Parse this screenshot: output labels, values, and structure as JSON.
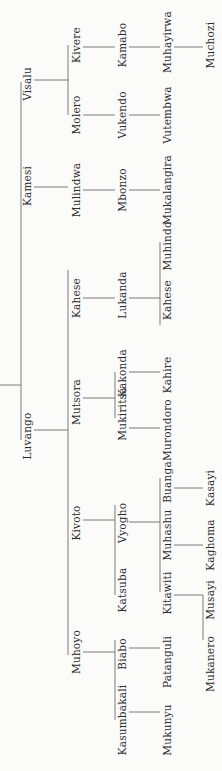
{
  "diagram": {
    "type": "genealogy-tree",
    "orientation": "rotated-90-ccw",
    "line_color": "#7a7a7a",
    "text_color": "#2a2a2a",
    "nodes": [
      {
        "id": "visalu",
        "name": "Visalu",
        "gen": 1,
        "x": 27,
        "y": 84
      },
      {
        "id": "kamesi",
        "name": "Kamesi",
        "gen": 1,
        "x": 27,
        "y": 186
      },
      {
        "id": "luvango",
        "name": "Luvango",
        "gen": 1,
        "x": 27,
        "y": 436
      },
      {
        "id": "kivere",
        "name": "Kivere",
        "gen": 2,
        "x": 76,
        "y": 45,
        "parent": "visalu"
      },
      {
        "id": "molero",
        "name": "Molero",
        "gen": 2,
        "x": 76,
        "y": 115,
        "parent": "visalu"
      },
      {
        "id": "mulindwa",
        "name": "Mulindwa",
        "gen": 2,
        "x": 76,
        "y": 190,
        "parent": "kamesi"
      },
      {
        "id": "kahese1",
        "name": "Kahese",
        "gen": 2,
        "x": 76,
        "y": 298,
        "parent": "luvango"
      },
      {
        "id": "mutsora",
        "name": "Mutsora",
        "gen": 2,
        "x": 76,
        "y": 402,
        "parent": "luvango"
      },
      {
        "id": "kivoto",
        "name": "Kivoto",
        "gen": 2,
        "x": 76,
        "y": 523,
        "parent": "luvango"
      },
      {
        "id": "muhoyo",
        "name": "Muhoyo",
        "gen": 2,
        "x": 76,
        "y": 652,
        "parent": "luvango"
      },
      {
        "id": "kamabo",
        "name": "Kamabo",
        "gen": 3,
        "x": 122,
        "y": 45,
        "parent": "kivere"
      },
      {
        "id": "vukendo",
        "name": "Vukendo",
        "gen": 3,
        "x": 122,
        "y": 115,
        "parent": "molero"
      },
      {
        "id": "mbonzo",
        "name": "Mbonzo",
        "gen": 3,
        "x": 122,
        "y": 190,
        "parent": "mulindwa"
      },
      {
        "id": "lukanda",
        "name": "Lukanda",
        "gen": 3,
        "x": 122,
        "y": 295,
        "parent": "kahese1"
      },
      {
        "id": "kakonda",
        "name": "Kakonda",
        "gen": 3,
        "x": 122,
        "y": 373,
        "parent": "mutsora"
      },
      {
        "id": "mukiritsa",
        "name": "Mukiritsa",
        "gen": 3,
        "x": 122,
        "y": 414,
        "parent": "mutsora"
      },
      {
        "id": "vyogho",
        "name": "Vyogho",
        "gen": 3,
        "x": 122,
        "y": 523,
        "parent": "kivoto"
      },
      {
        "id": "katsuba",
        "name": "Katsuba",
        "gen": 3,
        "x": 122,
        "y": 590,
        "parent": "kivoto"
      },
      {
        "id": "biabo",
        "name": "Biabo",
        "gen": 3,
        "x": 122,
        "y": 654,
        "parent": "muhoyo"
      },
      {
        "id": "kasumbakali",
        "name": "Kasumbakali",
        "gen": 3,
        "x": 122,
        "y": 720,
        "parent": "muhoyo"
      },
      {
        "id": "muhayirwa",
        "name": "Muhayirwa",
        "gen": 4,
        "x": 167,
        "y": 42,
        "parent": "kamabo"
      },
      {
        "id": "vutembwa",
        "name": "Vutembwa",
        "gen": 4,
        "x": 167,
        "y": 115,
        "parent": "vukendo"
      },
      {
        "id": "mukalangira",
        "name": "Mukalangira",
        "gen": 4,
        "x": 167,
        "y": 190,
        "parent": "mbonzo"
      },
      {
        "id": "muhindo",
        "name": "Muhindo",
        "gen": 4,
        "x": 167,
        "y": 246,
        "parent": "lukanda"
      },
      {
        "id": "kahese2",
        "name": "Kahese",
        "gen": 4,
        "x": 167,
        "y": 300,
        "parent": "lukanda"
      },
      {
        "id": "kahire",
        "name": "Kahire",
        "gen": 4,
        "x": 167,
        "y": 375,
        "parent": "kakonda"
      },
      {
        "id": "murondoro",
        "name": "Murondoro",
        "gen": 4,
        "x": 167,
        "y": 430,
        "parent": "mukiritsa"
      },
      {
        "id": "buanga",
        "name": "Buanga",
        "gen": 4,
        "x": 167,
        "y": 482,
        "parent": "vyogho"
      },
      {
        "id": "muhashu",
        "name": "Muhashu",
        "gen": 4,
        "x": 167,
        "y": 535,
        "parent": "vyogho"
      },
      {
        "id": "kitawiti",
        "name": "Kitawiti",
        "gen": 4,
        "x": 167,
        "y": 593,
        "parent": "vyogho"
      },
      {
        "id": "patanguli",
        "name": "Patanguli",
        "gen": 4,
        "x": 167,
        "y": 662,
        "parent": "biabo"
      },
      {
        "id": "mukunyu",
        "name": "Mukunyu",
        "gen": 4,
        "x": 167,
        "y": 730,
        "parent": "kasumbakali"
      },
      {
        "id": "muchozi",
        "name": "Muchozi",
        "gen": 5,
        "x": 210,
        "y": 45,
        "parent": "muhayirwa"
      },
      {
        "id": "kasayi",
        "name": "Kasayi",
        "gen": 5,
        "x": 210,
        "y": 488,
        "parent": "buanga"
      },
      {
        "id": "kaghoma",
        "name": "Kaghoma",
        "gen": 5,
        "x": 210,
        "y": 545,
        "parent": "muhashu"
      },
      {
        "id": "musayi",
        "name": "Musayi",
        "gen": 5,
        "x": 210,
        "y": 600,
        "parent": "kitawiti"
      },
      {
        "id": "mukanero",
        "name": "Mukanero",
        "gen": 5,
        "x": 210,
        "y": 664,
        "parent": "kitawiti"
      }
    ],
    "lines": [
      [
        0,
        385,
        21,
        385
      ],
      [
        21,
        82,
        21,
        440
      ],
      [
        34,
        80,
        68,
        80
      ],
      [
        68,
        45,
        68,
        115
      ],
      [
        34,
        187,
        68,
        187
      ],
      [
        34,
        430,
        68,
        430
      ],
      [
        68,
        270,
        68,
        655
      ],
      [
        83,
        47,
        115,
        47
      ],
      [
        83,
        115,
        115,
        115
      ],
      [
        83,
        190,
        115,
        190
      ],
      [
        83,
        298,
        115,
        298
      ],
      [
        83,
        398,
        115,
        398
      ],
      [
        115,
        372,
        115,
        418
      ],
      [
        83,
        520,
        115,
        520
      ],
      [
        115,
        505,
        115,
        595
      ],
      [
        83,
        652,
        115,
        652
      ],
      [
        115,
        640,
        115,
        720
      ],
      [
        129,
        47,
        160,
        47
      ],
      [
        129,
        115,
        160,
        115
      ],
      [
        129,
        190,
        160,
        190
      ],
      [
        129,
        298,
        160,
        298
      ],
      [
        160,
        242,
        160,
        325
      ],
      [
        129,
        372,
        160,
        372
      ],
      [
        129,
        428,
        160,
        428
      ],
      [
        129,
        522,
        160,
        522
      ],
      [
        160,
        478,
        160,
        592
      ],
      [
        129,
        648,
        160,
        648
      ],
      [
        129,
        712,
        160,
        712
      ],
      [
        174,
        47,
        203,
        47
      ],
      [
        174,
        488,
        203,
        488
      ],
      [
        174,
        545,
        203,
        545
      ],
      [
        174,
        595,
        203,
        595
      ],
      [
        203,
        595,
        203,
        640
      ]
    ]
  }
}
